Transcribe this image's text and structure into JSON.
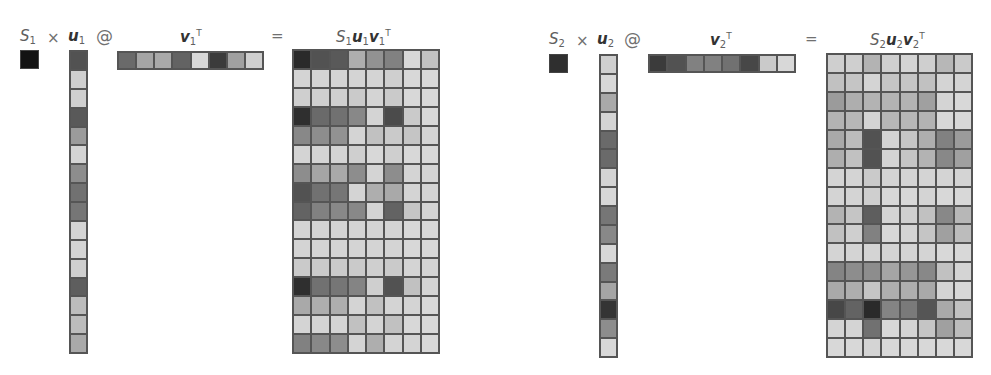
{
  "left": {
    "scalar_label": "S",
    "scalar_sub": "1",
    "times": "×",
    "u_label": "u",
    "u_sub": "1",
    "at": "@",
    "v_label": "v",
    "v_sub": "1",
    "v_sup": "T",
    "equals": "=",
    "result_label_s": "S",
    "result_label_s_sub": "1",
    "result_label_u": "u",
    "result_label_u_sub": "1",
    "result_label_v": "v",
    "result_label_v_sub": "1",
    "result_label_sup": "T",
    "scalar_value": 0.08,
    "u": [
      0.35,
      0.88,
      0.88,
      0.38,
      0.66,
      0.9,
      0.6,
      0.48,
      0.5,
      0.9,
      0.9,
      0.88,
      0.4,
      0.8,
      0.8,
      0.72
    ],
    "v": [
      0.45,
      0.7,
      0.72,
      0.42,
      0.92,
      0.25,
      0.68,
      0.88
    ],
    "matrix": [
      [
        0.18,
        0.35,
        0.38,
        0.74,
        0.62,
        0.55,
        0.92,
        0.82
      ],
      [
        0.9,
        0.9,
        0.9,
        0.9,
        0.9,
        0.88,
        0.92,
        0.92
      ],
      [
        0.88,
        0.88,
        0.88,
        0.86,
        0.9,
        0.86,
        0.92,
        0.92
      ],
      [
        0.2,
        0.45,
        0.48,
        0.58,
        0.9,
        0.32,
        0.86,
        0.92
      ],
      [
        0.58,
        0.6,
        0.62,
        0.9,
        0.82,
        0.86,
        0.84,
        0.9
      ],
      [
        0.9,
        0.9,
        0.9,
        0.88,
        0.92,
        0.88,
        0.92,
        0.92
      ],
      [
        0.6,
        0.7,
        0.72,
        0.6,
        0.9,
        0.6,
        0.9,
        0.9
      ],
      [
        0.35,
        0.48,
        0.5,
        0.9,
        0.74,
        0.72,
        0.9,
        0.9
      ],
      [
        0.42,
        0.55,
        0.58,
        0.58,
        0.9,
        0.42,
        0.84,
        0.9
      ],
      [
        0.9,
        0.9,
        0.9,
        0.9,
        0.9,
        0.9,
        0.92,
        0.92
      ],
      [
        0.9,
        0.9,
        0.9,
        0.9,
        0.9,
        0.9,
        0.92,
        0.92
      ],
      [
        0.86,
        0.86,
        0.86,
        0.86,
        0.88,
        0.86,
        0.9,
        0.9
      ],
      [
        0.2,
        0.48,
        0.5,
        0.56,
        0.88,
        0.35,
        0.82,
        0.9
      ],
      [
        0.72,
        0.74,
        0.74,
        0.9,
        0.82,
        0.9,
        0.9,
        0.92
      ],
      [
        0.9,
        0.9,
        0.9,
        0.82,
        0.9,
        0.82,
        0.92,
        0.92
      ],
      [
        0.55,
        0.58,
        0.6,
        0.9,
        0.74,
        0.9,
        0.9,
        0.92
      ]
    ]
  },
  "right": {
    "scalar_label": "S",
    "scalar_sub": "2",
    "times": "×",
    "u_label": "u",
    "u_sub": "2",
    "at": "@",
    "v_label": "v",
    "v_sub": "2",
    "v_sup": "T",
    "equals": "=",
    "result_label_s": "S",
    "result_label_s_sub": "2",
    "result_label_u": "u",
    "result_label_u_sub": "2",
    "result_label_v": "v",
    "result_label_v_sub": "2",
    "result_label_sup": "T",
    "scalar_value": 0.2,
    "u": [
      0.88,
      0.92,
      0.72,
      0.9,
      0.45,
      0.45,
      0.9,
      0.92,
      0.5,
      0.58,
      0.92,
      0.52,
      0.7,
      0.22,
      0.6,
      0.92
    ],
    "v": [
      0.25,
      0.35,
      0.55,
      0.55,
      0.48,
      0.3,
      0.86,
      0.92
    ],
    "matrix": [
      [
        0.88,
        0.88,
        0.76,
        0.88,
        0.9,
        0.88,
        0.78,
        0.86
      ],
      [
        0.82,
        0.84,
        0.9,
        0.84,
        0.84,
        0.82,
        0.9,
        0.9
      ],
      [
        0.66,
        0.74,
        0.76,
        0.76,
        0.76,
        0.68,
        0.9,
        0.92
      ],
      [
        0.76,
        0.78,
        0.9,
        0.78,
        0.78,
        0.76,
        0.92,
        0.92
      ],
      [
        0.72,
        0.8,
        0.35,
        0.9,
        0.84,
        0.74,
        0.55,
        0.66
      ],
      [
        0.74,
        0.82,
        0.35,
        0.9,
        0.84,
        0.76,
        0.58,
        0.68
      ],
      [
        0.9,
        0.9,
        0.86,
        0.9,
        0.9,
        0.9,
        0.9,
        0.9
      ],
      [
        0.9,
        0.9,
        0.88,
        0.92,
        0.92,
        0.9,
        0.92,
        0.92
      ],
      [
        0.76,
        0.84,
        0.4,
        0.9,
        0.88,
        0.82,
        0.58,
        0.78
      ],
      [
        0.82,
        0.88,
        0.55,
        0.92,
        0.9,
        0.84,
        0.68,
        0.8
      ],
      [
        0.9,
        0.9,
        0.9,
        0.9,
        0.9,
        0.9,
        0.92,
        0.92
      ],
      [
        0.56,
        0.6,
        0.6,
        0.7,
        0.64,
        0.58,
        0.82,
        0.9
      ],
      [
        0.72,
        0.74,
        0.84,
        0.74,
        0.74,
        0.72,
        0.9,
        0.92
      ],
      [
        0.3,
        0.42,
        0.18,
        0.56,
        0.52,
        0.36,
        0.72,
        0.82
      ],
      [
        0.9,
        0.9,
        0.48,
        0.92,
        0.9,
        0.84,
        0.68,
        0.8
      ],
      [
        0.92,
        0.92,
        0.9,
        0.92,
        0.92,
        0.92,
        0.92,
        0.92
      ]
    ]
  }
}
